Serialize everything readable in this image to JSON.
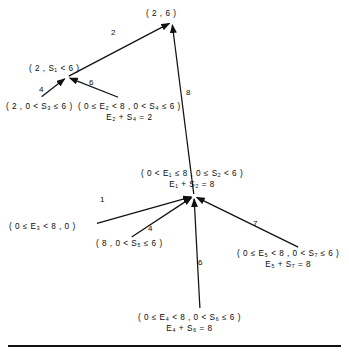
{
  "diagram": {
    "type": "state-transition-graph",
    "stroke_color": "#111111",
    "text_color": "#0b0b0b",
    "background": "#ffffff",
    "nodes": [
      {
        "id": "n-top",
        "name": "node-2-6",
        "x": 172,
        "y": 22,
        "label_lines": [
          "( 2 , 6 )"
        ],
        "label_x": 146,
        "label_y": 8
      },
      {
        "id": "n-s1",
        "name": "node-2-s1-lt6",
        "x": 67,
        "y": 77,
        "label_lines": [
          "( 2 , S₁ < 6 )"
        ],
        "label_x": 29,
        "label_y": 63
      },
      {
        "id": "n-s3",
        "name": "node-2-0-lt-s3-le6",
        "x": 40,
        "y": 98,
        "label_lines": [
          "( 2 , 0 < S₃ ≤ 6 )"
        ],
        "label_x": 6,
        "label_y": 101
      },
      {
        "id": "n-e2s4",
        "name": "node-e2-s4",
        "x": 120,
        "y": 98,
        "label_lines": [
          "( 0 ≤ E₂ < 8 , 0 < S₄ ≤ 6 )",
          "E₂ + S₄ = 2"
        ],
        "label_x": 78,
        "label_y": 101
      },
      {
        "id": "n-center",
        "name": "node-e1-s2-center",
        "x": 194,
        "y": 196,
        "label_lines": [
          "( 0 < E₁ ≤ 8 , 0 ≤ S₂ < 6 )",
          "E₁ + S₂ = 8"
        ],
        "label_x": 141,
        "label_y": 168
      },
      {
        "id": "n-e3",
        "name": "node-e3-0",
        "x": 95,
        "y": 224,
        "label_lines": [
          "( 0 ≤ E₃ < 8 , 0 )"
        ],
        "label_x": 9,
        "label_y": 221
      },
      {
        "id": "n-s5",
        "name": "node-8-s5",
        "x": 130,
        "y": 238,
        "label_lines": [
          "( 8 , 0 < S₅ ≤ 6 )"
        ],
        "label_x": 96,
        "label_y": 238
      },
      {
        "id": "n-e5s7",
        "name": "node-e5-s7",
        "x": 300,
        "y": 248,
        "label_lines": [
          "( 0 ≤ E₅ < 8 , 0 < S₇ ≤ 6 )",
          "E₅ + S₇ = 8"
        ],
        "label_x": 237,
        "label_y": 248
      },
      {
        "id": "n-e4s6",
        "name": "node-e4-s6",
        "x": 200,
        "y": 310,
        "label_lines": [
          "( 0 ≤ E₄ < 8 , 0 < S₆ ≤ 6 )",
          "E₄ + S₆ = 8"
        ],
        "label_x": 138,
        "label_y": 312
      }
    ],
    "edges": [
      {
        "name": "edge-s1-to-top",
        "from": "n-s1",
        "to": "n-top",
        "weight": "2",
        "wx": 111,
        "wy": 28
      },
      {
        "name": "edge-s3-to-s1",
        "from": "n-s3",
        "to": "n-s1",
        "weight": "4",
        "wx": 39,
        "wy": 85
      },
      {
        "name": "edge-e2s4-to-s1",
        "from": "n-e2s4",
        "to": "n-s1",
        "weight": "6",
        "wx": 89,
        "wy": 78
      },
      {
        "name": "edge-center-to-top",
        "from": "n-center",
        "to": "n-top",
        "weight": "8",
        "wx": 186,
        "wy": 88
      },
      {
        "name": "edge-e3-to-center",
        "from": "n-e3",
        "to": "n-center",
        "weight": "1",
        "wx": 100,
        "wy": 195
      },
      {
        "name": "edge-s5-to-center",
        "from": "n-s5",
        "to": "n-center",
        "weight": "4",
        "wx": 148,
        "wy": 224
      },
      {
        "name": "edge-e4s6-to-center",
        "from": "n-e4s6",
        "to": "n-center",
        "weight": "6",
        "wx": 198,
        "wy": 258
      },
      {
        "name": "edge-e5s7-to-center",
        "from": "n-e5s7",
        "to": "n-center",
        "weight": "7",
        "wx": 253,
        "wy": 219
      }
    ]
  }
}
